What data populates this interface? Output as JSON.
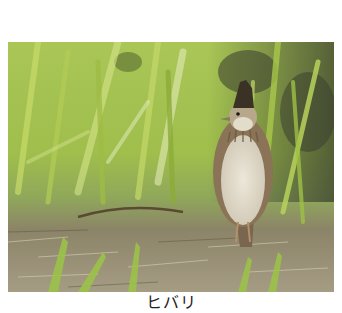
{
  "photo": {
    "subject": "skylark standing in grass",
    "colors": {
      "grass_light": "#b8cf5c",
      "grass_mid": "#8fae3a",
      "grass_dark": "#4f6a2a",
      "shadow": "#3a3f2e",
      "ground": "#8f8570",
      "ground_light": "#c9c0a8",
      "bird_body": "#d9d3c2",
      "bird_back": "#8a7356",
      "bird_crest": "#3b3226"
    }
  },
  "caption": {
    "text": "ヒバリ"
  }
}
